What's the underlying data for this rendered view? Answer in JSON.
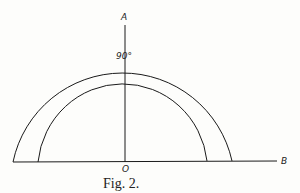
{
  "figure": {
    "caption": "Fig. 2.",
    "labels": {
      "top_axis": "A",
      "right_axis": "B",
      "origin": "O",
      "angle": "90°"
    },
    "stroke_color": "#1a1a1a",
    "background": "#fdfdfb"
  }
}
